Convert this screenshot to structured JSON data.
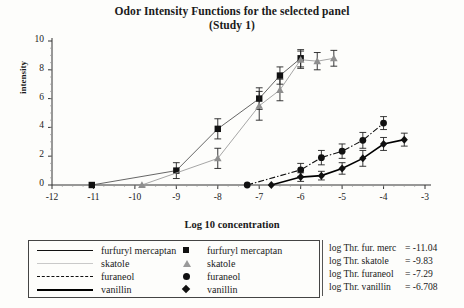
{
  "chart_data": {
    "type": "scatter",
    "title": "Odor Intensity Functions for the selected panel",
    "subtitle": "(Study 1)",
    "xlabel": "Log 10 concentration",
    "ylabel": "intensity",
    "xlim": [
      -12,
      -3
    ],
    "ylim": [
      0,
      10
    ],
    "xticks": [
      "-12",
      "-11",
      "-10",
      "-9",
      "-8",
      "-7",
      "-6",
      "-5",
      "-4",
      "-3"
    ],
    "yticks": [
      "0",
      "2",
      "4",
      "6",
      "8",
      "10"
    ],
    "grid": false,
    "legend_position": "bottom",
    "series": [
      {
        "name": "furfuryl mercaptan",
        "marker": "square",
        "line": "solid-thin",
        "x": [
          -11.04,
          -9,
          -8,
          -7,
          -6.5,
          -6
        ],
        "y": [
          0,
          1.0,
          3.9,
          6.0,
          7.6,
          8.8
        ],
        "yerr": [
          0,
          0.55,
          0.7,
          0.75,
          0.6,
          0.6
        ]
      },
      {
        "name": "skatole",
        "marker": "triangle",
        "line": "solid-faint",
        "x": [
          -9.83,
          -8,
          -7,
          -6.5,
          -6,
          -5.6,
          -5.2
        ],
        "y": [
          0,
          1.85,
          5.5,
          6.6,
          8.7,
          8.6,
          8.8
        ],
        "yerr": [
          0,
          0.7,
          1.0,
          0.75,
          0.6,
          0.6,
          0.55
        ]
      },
      {
        "name": "furaneol",
        "marker": "circle",
        "line": "dash-dot",
        "x": [
          -7.29,
          -6,
          -5.5,
          -5,
          -4.5,
          -4
        ],
        "y": [
          0,
          1.05,
          1.9,
          2.35,
          3.1,
          4.3
        ],
        "yerr": [
          0,
          0.45,
          0.5,
          0.5,
          0.55,
          0.45
        ]
      },
      {
        "name": "vanillin",
        "marker": "diamond",
        "line": "solid-thick",
        "x": [
          -6.708,
          -6,
          -5.5,
          -5,
          -4.5,
          -4,
          -3.5
        ],
        "y": [
          0,
          0.55,
          0.65,
          1.15,
          1.85,
          2.85,
          3.15
        ],
        "yerr": [
          0,
          0.3,
          0.3,
          0.4,
          0.55,
          0.45,
          0.45
        ]
      }
    ],
    "threshold_markers": [
      {
        "name": "furfuryl mercaptan",
        "x": -11.04,
        "marker": "square"
      },
      {
        "name": "skatole",
        "x": -9.83,
        "marker": "triangle"
      },
      {
        "name": "furaneol",
        "x": -7.29,
        "marker": "circle"
      },
      {
        "name": "vanillin",
        "x": -6.708,
        "marker": "diamond"
      }
    ]
  },
  "legend": {
    "lines": [
      {
        "label": "furfuryl mercaptan",
        "style": "solid-thin"
      },
      {
        "label": "skatole",
        "style": "solid-faint"
      },
      {
        "label": "furaneol",
        "style": "dash-dot"
      },
      {
        "label": "vanillin",
        "style": "solid-thick"
      }
    ],
    "markers": [
      {
        "label": "furfuryl mercaptan",
        "marker": "square"
      },
      {
        "label": "skatole",
        "marker": "triangle"
      },
      {
        "label": "furaneol",
        "marker": "circle"
      },
      {
        "label": "vanillin",
        "marker": "diamond"
      }
    ]
  },
  "thresholds": [
    {
      "name": "log Thr. fur. merc",
      "eq": "=",
      "value": "-11.04"
    },
    {
      "name": "log Thr. skatole",
      "eq": "=",
      "value": "-9.83"
    },
    {
      "name": "log Thr. furaneol",
      "eq": "=",
      "value": "-7.29"
    },
    {
      "name": "log Thr. vanillin",
      "eq": "=",
      "value": "-6.708"
    }
  ]
}
